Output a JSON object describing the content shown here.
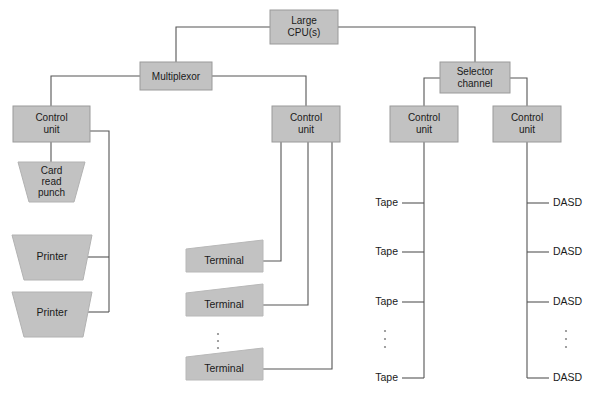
{
  "diagram": {
    "colors": {
      "box_fill": "#c2c2c2",
      "box_stroke": "#9a9a9a",
      "line": "#555555",
      "text": "#1a1a1a",
      "background": "#ffffff"
    },
    "nodes": {
      "cpu": {
        "label": "Large\nCPU(s)",
        "line1": "Large",
        "line2": "CPU(s)"
      },
      "multiplexor": {
        "label": "Multiplexor"
      },
      "selector_channel": {
        "line1": "Selector",
        "line2": "channel"
      },
      "control_unit_1": {
        "line1": "Control",
        "line2": "unit"
      },
      "control_unit_2": {
        "line1": "Control",
        "line2": "unit"
      },
      "control_unit_3": {
        "line1": "Control",
        "line2": "unit"
      },
      "control_unit_4": {
        "line1": "Control",
        "line2": "unit"
      }
    },
    "devices": {
      "card_read_punch": {
        "line1": "Card",
        "line2": "read",
        "line3": "punch"
      },
      "printer_1": {
        "label": "Printer"
      },
      "printer_2": {
        "label": "Printer"
      },
      "terminal_1": {
        "label": "Terminal"
      },
      "terminal_2": {
        "label": "Terminal"
      },
      "terminal_3": {
        "label": "Terminal"
      },
      "tape_1": {
        "label": "Tape"
      },
      "tape_2": {
        "label": "Tape"
      },
      "tape_3": {
        "label": "Tape"
      },
      "tape_4": {
        "label": "Tape"
      },
      "dasd_1": {
        "label": "DASD"
      },
      "dasd_2": {
        "label": "DASD"
      },
      "dasd_3": {
        "label": "DASD"
      },
      "dasd_4": {
        "label": "DASD"
      }
    },
    "ellipses": {
      "terminal_ellipsis": "⋮",
      "tape_ellipsis": "⋮",
      "dasd_ellipsis": "⋮"
    }
  }
}
